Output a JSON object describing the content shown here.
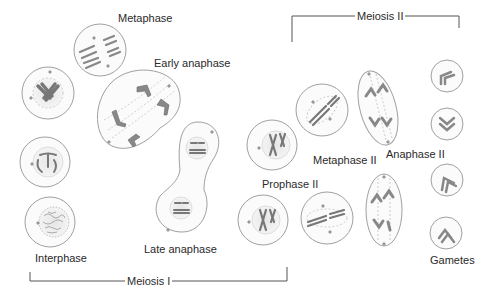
{
  "diagram": {
    "labels": {
      "metaphase": "Metaphase",
      "early_anaphase": "Early anaphase",
      "late_anaphase": "Late anaphase",
      "interphase": "Interphase",
      "prophase_ii": "Prophase II",
      "metaphase_ii": "Metaphase II",
      "anaphase_ii": "Anaphase II",
      "gametes": "Gametes"
    },
    "brackets": {
      "meiosis_i": "Meiosis I",
      "meiosis_ii": "Meiosis II"
    },
    "colors": {
      "cell_outline": "#9a9a9a",
      "chromosome": "#8a8a8a",
      "text": "#2a2a2a",
      "bracket": "#555555"
    }
  }
}
